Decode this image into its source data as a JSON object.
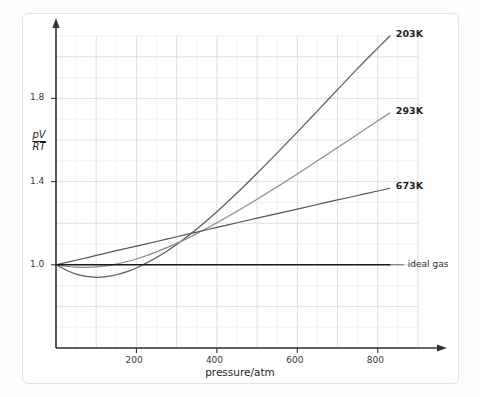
{
  "chart_data": {
    "type": "line",
    "title": "",
    "xlabel": "pressure/atm",
    "ylabel": "pV/RT",
    "ylabel_numerator": "pV",
    "ylabel_denominator": "RT",
    "xlim": [
      0,
      900
    ],
    "ylim": [
      0.6,
      2.1
    ],
    "xticks": [
      200,
      400,
      600,
      800
    ],
    "xtick_labels": [
      "200",
      "400",
      "600",
      "800"
    ],
    "yticks": [
      1.0,
      1.4,
      1.8
    ],
    "ytick_labels": [
      "1.0",
      "1.4",
      "1.8"
    ],
    "grid": true,
    "grid_major_step_x": 100,
    "grid_minor_step_x": 50,
    "grid_major_step_y": 0.2,
    "grid_minor_step_y": 0.1,
    "legend_position": "right-inline-labels",
    "series": [
      {
        "name": "203K",
        "label": "203K",
        "color": "#5a5a5a",
        "label_x": 820,
        "label_y": 2.02,
        "x": [
          0,
          25,
          50,
          75,
          100,
          125,
          150,
          175,
          200,
          250,
          300,
          350,
          400,
          450,
          500,
          550,
          600,
          650,
          700,
          750,
          800,
          830
        ],
        "y": [
          1.0,
          0.975,
          0.955,
          0.944,
          0.94,
          0.943,
          0.952,
          0.966,
          0.985,
          1.035,
          1.098,
          1.172,
          1.255,
          1.345,
          1.44,
          1.538,
          1.638,
          1.74,
          1.842,
          1.944,
          2.042,
          2.1
        ]
      },
      {
        "name": "293K",
        "label": "293K",
        "color": "#8a8a8a",
        "label_x": 820,
        "label_y": 1.79,
        "x": [
          0,
          25,
          50,
          75,
          100,
          125,
          150,
          200,
          250,
          300,
          350,
          400,
          450,
          500,
          550,
          600,
          650,
          700,
          750,
          800,
          830
        ],
        "y": [
          1.0,
          0.993,
          0.989,
          0.988,
          0.99,
          0.995,
          1.003,
          1.028,
          1.062,
          1.103,
          1.15,
          1.202,
          1.257,
          1.315,
          1.375,
          1.437,
          1.5,
          1.564,
          1.628,
          1.692,
          1.73
        ]
      },
      {
        "name": "673K",
        "label": "673K",
        "color": "#555555",
        "label_x": 820,
        "label_y": 1.425,
        "x": [
          0,
          50,
          100,
          150,
          200,
          250,
          300,
          350,
          400,
          450,
          500,
          550,
          600,
          650,
          700,
          750,
          800,
          830
        ],
        "y": [
          1.0,
          1.022,
          1.045,
          1.068,
          1.09,
          1.112,
          1.135,
          1.157,
          1.18,
          1.202,
          1.224,
          1.246,
          1.268,
          1.29,
          1.312,
          1.333,
          1.355,
          1.368
        ]
      },
      {
        "name": "ideal gas",
        "label": "ideal gas",
        "color": "#1a1a1a",
        "label_x": 820,
        "label_y": 1.0,
        "x": [
          0,
          830
        ],
        "y": [
          1.0,
          1.0
        ]
      }
    ]
  }
}
